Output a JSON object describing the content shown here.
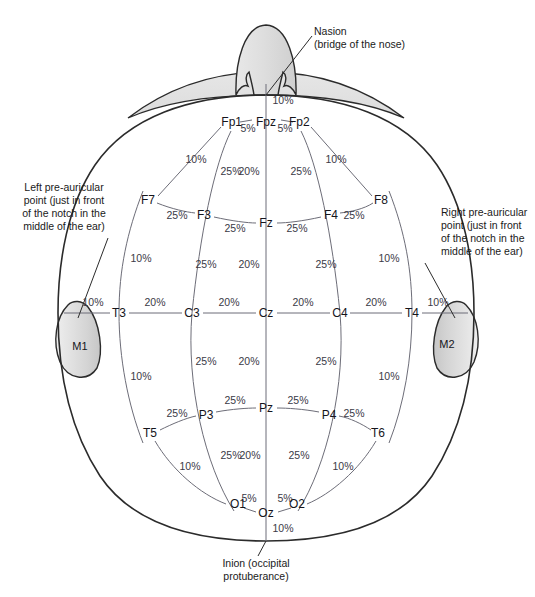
{
  "figure": {
    "type": "anatomical-diagram"
  },
  "colors": {
    "outline": "#2b2b2b",
    "measure_line": "#6d6d78",
    "text": "#1a1a1a",
    "pct_text": "#3a3a46",
    "nose_fill": "#d9d9d9",
    "forehead_fill": "#e3e3e3",
    "ear_fill": "#d5d5d5",
    "background": "#ffffff"
  },
  "annotations": {
    "nasion": {
      "line1": "Nasion",
      "line2": "(bridge of the nose)",
      "x": 314,
      "y": 31
    },
    "inion": {
      "line1": "Inion (occipital",
      "line2": "protuberance)",
      "x": 266,
      "y": 566
    },
    "left_preauricular": {
      "line1": "Left pre-auricular",
      "line2": "point (just in front",
      "line3": "of the notch in the",
      "line4": "middle of the ear)",
      "x": 58,
      "y": 188
    },
    "right_preauricular": {
      "line1": "Right pre-auricular",
      "line2": "point (just in front",
      "line3": "of the notch in the",
      "line4": "middle of the ear)",
      "x": 443,
      "y": 213
    }
  },
  "electrodes": [
    {
      "id": "Fp1",
      "label": "Fp1",
      "x": 228,
      "y": 122,
      "anchor": "end",
      "dx": 14,
      "dy": 0
    },
    {
      "id": "Fpz",
      "label": "Fpz",
      "x": 266,
      "y": 122,
      "anchor": "middle",
      "dx": 0,
      "dy": 0
    },
    {
      "id": "Fp2",
      "label": "Fp2",
      "x": 303,
      "y": 122,
      "anchor": "start",
      "dx": -14,
      "dy": 0
    },
    {
      "id": "F7",
      "label": "F7",
      "x": 148,
      "y": 200,
      "anchor": "middle",
      "dx": 0,
      "dy": 0
    },
    {
      "id": "F3",
      "label": "F3",
      "x": 204,
      "y": 215,
      "anchor": "middle",
      "dx": 0,
      "dy": 0
    },
    {
      "id": "Fz",
      "label": "Fz",
      "x": 266,
      "y": 223,
      "anchor": "middle",
      "dx": 0,
      "dy": 0
    },
    {
      "id": "F4",
      "label": "F4",
      "x": 331,
      "y": 215,
      "anchor": "middle",
      "dx": 0,
      "dy": 0
    },
    {
      "id": "F8",
      "label": "F8",
      "x": 381,
      "y": 200,
      "anchor": "middle",
      "dx": 0,
      "dy": 0
    },
    {
      "id": "T3",
      "label": "T3",
      "x": 119,
      "y": 313,
      "anchor": "middle",
      "dx": 0,
      "dy": 0
    },
    {
      "id": "C3",
      "label": "C3",
      "x": 192,
      "y": 313,
      "anchor": "middle",
      "dx": 0,
      "dy": 0
    },
    {
      "id": "Cz",
      "label": "Cz",
      "x": 266,
      "y": 313,
      "anchor": "middle",
      "dx": 0,
      "dy": 0
    },
    {
      "id": "C4",
      "label": "C4",
      "x": 340,
      "y": 313,
      "anchor": "middle",
      "dx": 0,
      "dy": 0
    },
    {
      "id": "T4",
      "label": "T4",
      "x": 412,
      "y": 313,
      "anchor": "middle",
      "dx": 0,
      "dy": 0
    },
    {
      "id": "T5",
      "label": "T5",
      "x": 150,
      "y": 433,
      "anchor": "middle",
      "dx": 0,
      "dy": 0
    },
    {
      "id": "P3",
      "label": "P3",
      "x": 206,
      "y": 415,
      "anchor": "middle",
      "dx": 0,
      "dy": 0
    },
    {
      "id": "Pz",
      "label": "Pz",
      "x": 266,
      "y": 408,
      "anchor": "middle",
      "dx": 0,
      "dy": 0
    },
    {
      "id": "P4",
      "label": "P4",
      "x": 329,
      "y": 415,
      "anchor": "middle",
      "dx": 0,
      "dy": 0
    },
    {
      "id": "T6",
      "label": "T6",
      "x": 378,
      "y": 433,
      "anchor": "middle",
      "dx": 0,
      "dy": 0
    },
    {
      "id": "O1",
      "label": "O1",
      "x": 235,
      "y": 504,
      "anchor": "end",
      "dx": 11,
      "dy": 0
    },
    {
      "id": "Oz",
      "label": "Oz",
      "x": 266,
      "y": 513,
      "anchor": "middle",
      "dx": 0,
      "dy": 0
    },
    {
      "id": "O2",
      "label": "O2",
      "x": 300,
      "y": 504,
      "anchor": "start",
      "dx": -11,
      "dy": 0
    }
  ],
  "mastoids": [
    {
      "id": "M1",
      "label": "M1",
      "x": 80,
      "y": 350
    },
    {
      "id": "M2",
      "label": "M2",
      "x": 447,
      "y": 348
    }
  ],
  "percent_labels": [
    {
      "id": "p-nasion-fpz",
      "text": "10%",
      "x": 283,
      "y": 104
    },
    {
      "id": "p-fp1-fpz",
      "text": "5%",
      "x": 248,
      "y": 132
    },
    {
      "id": "p-fpz-fp2",
      "text": "5%",
      "x": 285,
      "y": 132
    },
    {
      "id": "p-fp1-f7",
      "text": "10%",
      "x": 196,
      "y": 163
    },
    {
      "id": "p-fp2-f8",
      "text": "10%",
      "x": 336,
      "y": 163
    },
    {
      "id": "p-fp1-f3",
      "text": "25%",
      "x": 231,
      "y": 175
    },
    {
      "id": "p-fpz-fz",
      "text": "20%",
      "x": 249,
      "y": 175
    },
    {
      "id": "p-fp2-f4",
      "text": "25%",
      "x": 301,
      "y": 175
    },
    {
      "id": "p-f7-f3",
      "text": "25%",
      "x": 177,
      "y": 219
    },
    {
      "id": "p-f3-fz",
      "text": "25%",
      "x": 235,
      "y": 232
    },
    {
      "id": "p-fz-f4",
      "text": "25%",
      "x": 297,
      "y": 232
    },
    {
      "id": "p-f4-f8",
      "text": "25%",
      "x": 354,
      "y": 219
    },
    {
      "id": "p-f7-t3",
      "text": "10%",
      "x": 141,
      "y": 262
    },
    {
      "id": "p-f8-t4",
      "text": "10%",
      "x": 389,
      "y": 262
    },
    {
      "id": "p-f3-c3",
      "text": "25%",
      "x": 206,
      "y": 268
    },
    {
      "id": "p-fz-cz",
      "text": "20%",
      "x": 249,
      "y": 268
    },
    {
      "id": "p-f4-c4",
      "text": "25%",
      "x": 326,
      "y": 268
    },
    {
      "id": "p-lpa-t3",
      "text": "10%",
      "x": 93,
      "y": 306
    },
    {
      "id": "p-t3-c3",
      "text": "20%",
      "x": 155,
      "y": 306
    },
    {
      "id": "p-c3-cz",
      "text": "20%",
      "x": 229,
      "y": 306
    },
    {
      "id": "p-cz-c4",
      "text": "20%",
      "x": 303,
      "y": 306
    },
    {
      "id": "p-c4-t4",
      "text": "20%",
      "x": 376,
      "y": 306
    },
    {
      "id": "p-t4-rpa",
      "text": "10%",
      "x": 438,
      "y": 306
    },
    {
      "id": "p-c3-p3",
      "text": "25%",
      "x": 206,
      "y": 365
    },
    {
      "id": "p-cz-pz",
      "text": "20%",
      "x": 249,
      "y": 365
    },
    {
      "id": "p-c4-p4",
      "text": "25%",
      "x": 326,
      "y": 365
    },
    {
      "id": "p-t3-t5",
      "text": "10%",
      "x": 141,
      "y": 380
    },
    {
      "id": "p-t4-t6",
      "text": "10%",
      "x": 389,
      "y": 380
    },
    {
      "id": "p-p3-pz",
      "text": "25%",
      "x": 235,
      "y": 404
    },
    {
      "id": "p-pz-p4",
      "text": "25%",
      "x": 298,
      "y": 404
    },
    {
      "id": "p-t5-p3",
      "text": "25%",
      "x": 177,
      "y": 417
    },
    {
      "id": "p-p4-t6",
      "text": "25%",
      "x": 354,
      "y": 417
    },
    {
      "id": "p-p3-o1",
      "text": "25%",
      "x": 231,
      "y": 459
    },
    {
      "id": "p-pz-oz",
      "text": "20%",
      "x": 250,
      "y": 459
    },
    {
      "id": "p-p4-o2",
      "text": "25%",
      "x": 299,
      "y": 459
    },
    {
      "id": "p-t5-o1",
      "text": "10%",
      "x": 190,
      "y": 470
    },
    {
      "id": "p-t6-o2",
      "text": "10%",
      "x": 343,
      "y": 470
    },
    {
      "id": "p-o1-oz",
      "text": "5%",
      "x": 249,
      "y": 502
    },
    {
      "id": "p-oz-o2",
      "text": "5%",
      "x": 285,
      "y": 502
    },
    {
      "id": "p-oz-inion",
      "text": "10%",
      "x": 283,
      "y": 532
    }
  ],
  "measurement_chains": {
    "sagittal_midline": {
      "name": "Nasion to Inion midline",
      "points": [
        "Nasion",
        "Fpz",
        "Fz",
        "Cz",
        "Pz",
        "Oz",
        "Inion"
      ],
      "distances": [
        "10%",
        "20%",
        "20%",
        "20%",
        "20%",
        "10%"
      ]
    },
    "coronal_central": {
      "name": "Left pre-auricular to Right pre-auricular",
      "points": [
        "LPA",
        "T3",
        "C3",
        "Cz",
        "C4",
        "T4",
        "RPA"
      ],
      "distances": [
        "10%",
        "20%",
        "20%",
        "20%",
        "20%",
        "10%"
      ]
    },
    "circumference": {
      "name": "Head circumference chain",
      "points": [
        "Fpz",
        "Fp1",
        "F7",
        "T3",
        "T5",
        "O1",
        "Oz",
        "O2",
        "T6",
        "T4",
        "F8",
        "Fp2",
        "Fpz"
      ],
      "distances": [
        "5%",
        "10%",
        "10%",
        "10%",
        "10%",
        "5%",
        "5%",
        "10%",
        "10%",
        "10%",
        "10%",
        "5%"
      ]
    },
    "frontal_row": {
      "name": "F7 - F3 - Fz - F4 - F8",
      "distances": [
        "25%",
        "25%",
        "25%",
        "25%"
      ]
    },
    "parietal_row": {
      "name": "T5 - P3 - Pz - P4 - T6",
      "distances": [
        "25%",
        "25%",
        "25%",
        "25%"
      ]
    },
    "longitudinal_parasagittal": {
      "name": "Fp1 - F3 - C3 - P3 - O1",
      "distances": [
        "25%",
        "25%",
        "25%",
        "25%"
      ]
    }
  }
}
